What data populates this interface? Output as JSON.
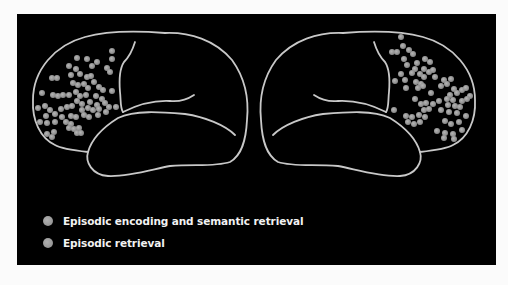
{
  "figure": {
    "background": "#000000",
    "outline_color": "#c8c8c8",
    "dot_color": "#9a9a9a"
  },
  "brains": [
    {
      "name": "left-hemisphere",
      "highlighted_region": "frontal",
      "dots_series": 0
    },
    {
      "name": "right-hemisphere",
      "highlighted_region": "frontal",
      "dots_series": 1
    }
  ],
  "legend": {
    "items": [
      {
        "label": "Episodic encoding and semantic retrieval",
        "color": "#9a9a9a"
      },
      {
        "label": "Episodic retrieval",
        "color": "#9a9a9a"
      }
    ]
  }
}
